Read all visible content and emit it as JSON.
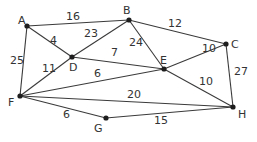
{
  "graph": {
    "nodes": [
      {
        "id": "A",
        "label": "A"
      },
      {
        "id": "B",
        "label": "B"
      },
      {
        "id": "C",
        "label": "C"
      },
      {
        "id": "D",
        "label": "D"
      },
      {
        "id": "E",
        "label": "E"
      },
      {
        "id": "F",
        "label": "F"
      },
      {
        "id": "G",
        "label": "G"
      },
      {
        "id": "H",
        "label": "H"
      }
    ],
    "edges": [
      {
        "from": "A",
        "to": "B",
        "weight": "16"
      },
      {
        "from": "A",
        "to": "D",
        "weight": "4"
      },
      {
        "from": "A",
        "to": "F",
        "weight": "25"
      },
      {
        "from": "B",
        "to": "D",
        "weight": "23"
      },
      {
        "from": "B",
        "to": "E",
        "weight": "24"
      },
      {
        "from": "B",
        "to": "C",
        "weight": "12"
      },
      {
        "from": "D",
        "to": "E",
        "weight": "7"
      },
      {
        "from": "D",
        "to": "F",
        "weight": "11"
      },
      {
        "from": "F",
        "to": "E",
        "weight": "6"
      },
      {
        "from": "C",
        "to": "E",
        "weight": "10"
      },
      {
        "from": "C",
        "to": "H",
        "weight": "27"
      },
      {
        "from": "E",
        "to": "H",
        "weight": "10"
      },
      {
        "from": "F",
        "to": "H",
        "weight": "20"
      },
      {
        "from": "F",
        "to": "G",
        "weight": "6"
      },
      {
        "from": "G",
        "to": "H",
        "weight": "15"
      }
    ]
  }
}
